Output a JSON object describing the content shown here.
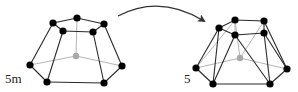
{
  "colors": {
    "edge": "#2a2a2a",
    "hidden_edge": "#b5b5b5",
    "vertex": "#000000",
    "hidden_vertex": "#a8a8a8",
    "arrow": "#333333",
    "background": "#ffffff"
  },
  "labels": {
    "left": "5m",
    "right": "5"
  },
  "left_polyhedron": {
    "vertices": {
      "tl": [
        53,
        23
      ],
      "tb": [
        77,
        18
      ],
      "tr": [
        104,
        24
      ],
      "fl": [
        63,
        31
      ],
      "fr": [
        93,
        32
      ],
      "l": [
        30,
        65
      ],
      "bl": [
        47,
        82
      ],
      "br": [
        104,
        83
      ],
      "r": [
        122,
        66
      ],
      "c": [
        76,
        56
      ]
    },
    "edges": [
      [
        "tl",
        "tb"
      ],
      [
        "tb",
        "tr"
      ],
      [
        "tl",
        "fl"
      ],
      [
        "fl",
        "fr"
      ],
      [
        "fr",
        "tr"
      ],
      [
        "tl",
        "l"
      ],
      [
        "fl",
        "bl"
      ],
      [
        "fr",
        "br"
      ],
      [
        "tr",
        "r"
      ],
      [
        "l",
        "bl"
      ],
      [
        "bl",
        "br"
      ],
      [
        "br",
        "r"
      ]
    ],
    "hidden_edges": [
      [
        "c",
        "tb"
      ],
      [
        "c",
        "l"
      ],
      [
        "c",
        "r"
      ]
    ],
    "hidden_vertices": [
      "c"
    ]
  },
  "right_polyhedron": {
    "vertices": {
      "a": [
        219,
        28
      ],
      "b": [
        235,
        20
      ],
      "c": [
        264,
        21
      ],
      "d": [
        235,
        35
      ],
      "e": [
        264,
        33
      ],
      "f": [
        196,
        68
      ],
      "g": [
        213,
        84
      ],
      "h": [
        270,
        84
      ],
      "i": [
        287,
        69
      ],
      "j": [
        240,
        58
      ]
    },
    "edges": [
      [
        "a",
        "b"
      ],
      [
        "b",
        "c"
      ],
      [
        "a",
        "d"
      ],
      [
        "d",
        "e"
      ],
      [
        "c",
        "e"
      ],
      [
        "a",
        "f"
      ],
      [
        "a",
        "g"
      ],
      [
        "d",
        "g"
      ],
      [
        "d",
        "h"
      ],
      [
        "e",
        "h"
      ],
      [
        "e",
        "i"
      ],
      [
        "c",
        "i"
      ],
      [
        "f",
        "g"
      ],
      [
        "g",
        "h"
      ],
      [
        "h",
        "i"
      ]
    ],
    "hidden_edges": [
      [
        "j",
        "f"
      ],
      [
        "j",
        "i"
      ],
      [
        "j",
        "b"
      ],
      [
        "j",
        "c"
      ],
      [
        "b",
        "f"
      ],
      [
        "b",
        "d"
      ]
    ],
    "hidden_vertices": [
      "j"
    ]
  },
  "arrow": {
    "path": "M118 16 Q160 -6 204 21"
  }
}
